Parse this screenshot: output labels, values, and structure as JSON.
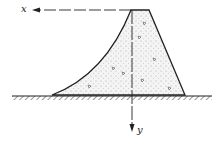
{
  "diagram": {
    "axis_x_label": "x",
    "axis_y_label": "y",
    "colors": {
      "ink": "#222222",
      "fill": "#f4f4f4"
    }
  }
}
